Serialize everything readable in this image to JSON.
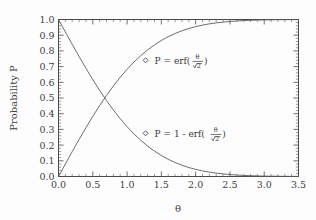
{
  "figure": {
    "background_color": "#fdfdfd",
    "axis_color": "#4a4a4a",
    "curve_color": "#5c5c5c"
  },
  "chart_data": {
    "type": "line",
    "title": "",
    "xlabel": "θ",
    "ylabel": "Probability P",
    "xlim": [
      0.0,
      3.5
    ],
    "ylim": [
      0.0,
      1.0
    ],
    "grid": false,
    "legend_position": "inline-annotations",
    "x_ticks": [
      "0.0",
      "0.5",
      "1.0",
      "1.5",
      "2.0",
      "2.5",
      "3.0",
      "3.5"
    ],
    "x_tick_values": [
      0.0,
      0.5,
      1.0,
      1.5,
      2.0,
      2.5,
      3.0,
      3.5
    ],
    "x_minor_tick_step": 0.1,
    "y_ticks": [
      "0.0",
      "0.1",
      "0.2",
      "0.3",
      "0.4",
      "0.5",
      "0.6",
      "0.7",
      "0.8",
      "0.9",
      "1.0"
    ],
    "y_tick_values": [
      0.0,
      0.1,
      0.2,
      0.3,
      0.4,
      0.5,
      0.6,
      0.7,
      0.8,
      0.9,
      1.0
    ],
    "y_minor_tick_step": 0.02,
    "x": [
      0.0,
      0.1,
      0.2,
      0.3,
      0.4,
      0.5,
      0.6,
      0.7,
      0.8,
      0.9,
      1.0,
      1.1,
      1.2,
      1.3,
      1.4,
      1.5,
      1.6,
      1.7,
      1.8,
      1.9,
      2.0,
      2.1,
      2.2,
      2.3,
      2.4,
      2.5,
      2.6,
      2.7,
      2.8,
      2.9,
      3.0,
      3.1,
      3.2,
      3.3,
      3.4,
      3.5
    ],
    "series": [
      {
        "name": "P = erf(θ/√2)",
        "values": [
          0.0,
          0.0797,
          0.1585,
          0.2358,
          0.3108,
          0.3829,
          0.4515,
          0.5161,
          0.5763,
          0.6319,
          0.6827,
          0.7287,
          0.7699,
          0.8064,
          0.8385,
          0.8664,
          0.8904,
          0.9109,
          0.9281,
          0.9426,
          0.9545,
          0.9643,
          0.9722,
          0.9786,
          0.9836,
          0.9876,
          0.9907,
          0.9931,
          0.9949,
          0.9963,
          0.9973,
          0.9981,
          0.9986,
          0.999,
          0.9993,
          0.9995
        ]
      },
      {
        "name": "P = 1 - erf(θ/√2)",
        "values": [
          1.0,
          0.9203,
          0.8415,
          0.7642,
          0.6892,
          0.6171,
          0.5485,
          0.4839,
          0.4237,
          0.3681,
          0.3173,
          0.2713,
          0.2301,
          0.1936,
          0.1615,
          0.1336,
          0.1096,
          0.0891,
          0.0719,
          0.0574,
          0.0455,
          0.0357,
          0.0278,
          0.0214,
          0.0164,
          0.0124,
          0.0093,
          0.0069,
          0.0051,
          0.0037,
          0.0027,
          0.0019,
          0.0014,
          0.001,
          0.0007,
          0.0005
        ]
      }
    ],
    "annotations": [
      {
        "id": "upper",
        "marker": "diamond",
        "marker_x": 1.27,
        "marker_y": 0.74,
        "prefix": "P = erf(",
        "numerator": "θ",
        "denominator": "2",
        "radical": true,
        "suffix": ")"
      },
      {
        "id": "lower",
        "marker": "diamond",
        "marker_x": 1.27,
        "marker_y": 0.275,
        "prefix": "P = 1 - erf(",
        "numerator": "θ",
        "denominator": "2",
        "radical": true,
        "suffix": ")"
      }
    ]
  }
}
